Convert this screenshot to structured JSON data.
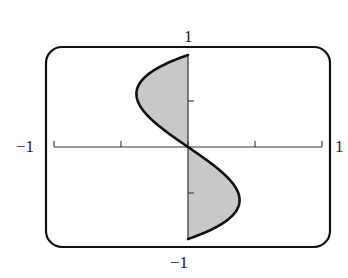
{
  "chart_data": {
    "type": "area",
    "title": "",
    "equation": "x = y^3 - y",
    "xlabel": "",
    "ylabel": "",
    "xlim": [
      -1,
      1
    ],
    "ylim": [
      -1,
      1
    ],
    "x_tick_labels": [
      "-1",
      "1"
    ],
    "y_tick_labels": [
      "1",
      "-1"
    ],
    "x_ticks": [
      -1,
      -0.5,
      0,
      0.5,
      1
    ],
    "y_ticks": [
      -0.5,
      0.5
    ],
    "grid": false,
    "shaded_regions": [
      "between curve and y-axis for 0<=y<=1 (left side)",
      "between curve and y-axis for -1<=y<=0 (right side)"
    ],
    "series": [
      {
        "name": "x = y^3 - y",
        "points": [
          {
            "y": 1.0,
            "x": 0.0
          },
          {
            "y": 0.8,
            "x": -0.288
          },
          {
            "y": 0.577,
            "x": -0.385
          },
          {
            "y": 0.4,
            "x": -0.336
          },
          {
            "y": 0.2,
            "x": -0.192
          },
          {
            "y": 0.0,
            "x": 0.0
          },
          {
            "y": -0.2,
            "x": 0.192
          },
          {
            "y": -0.4,
            "x": 0.336
          },
          {
            "y": -0.577,
            "x": 0.385
          },
          {
            "y": -0.8,
            "x": 0.288
          },
          {
            "y": -1.0,
            "x": 0.0
          }
        ]
      }
    ]
  },
  "labels": {
    "top": "1",
    "bottom": "−1",
    "left": "−1",
    "right": "1"
  },
  "colors": {
    "fill": "#c8c8c8",
    "stroke": "#111111"
  }
}
